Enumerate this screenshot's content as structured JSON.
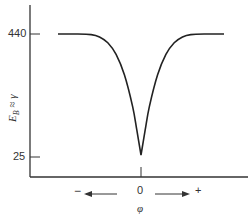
{
  "chart_data": {
    "type": "line",
    "title": "",
    "xlabel": "φ",
    "ylabel": "E_B ≈ γ",
    "ylabel_parts": {
      "main": "E",
      "sub": "B",
      "rest": " ≈ γ"
    },
    "x_tick_labels": [
      "0"
    ],
    "x_direction_labels": {
      "negative": "−",
      "positive": "+"
    },
    "y_tick_labels": [
      "440",
      "25"
    ],
    "yticks": [
      440,
      25
    ],
    "grid": false,
    "legend": null,
    "series": [
      {
        "name": "E_B",
        "x": [
          -1.0,
          -0.8,
          -0.6,
          -0.5,
          -0.4,
          -0.3,
          -0.2,
          -0.1,
          -0.05,
          0.0,
          0.05,
          0.1,
          0.2,
          0.3,
          0.4,
          0.5,
          0.6,
          0.8,
          1.0
        ],
        "values": [
          440,
          440,
          438,
          430,
          410,
          370,
          300,
          190,
          110,
          25,
          110,
          190,
          300,
          370,
          410,
          430,
          438,
          440,
          440
        ]
      }
    ],
    "ylim": [
      0,
      500
    ],
    "xlim": [
      -1.0,
      1.0
    ]
  }
}
